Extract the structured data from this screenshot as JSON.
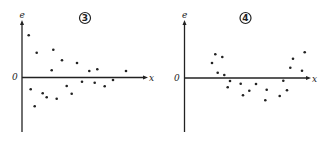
{
  "chart_data": [
    {
      "type": "scatter",
      "title": "3",
      "xlabel": "x",
      "ylabel": "e",
      "origin_label": "0",
      "grid": false,
      "description": "Residual plot: residuals e vs x, spread decreasing (funnel narrowing) as x increases",
      "origin_px": [
        22,
        77.5
      ],
      "points_px": [
        [
          28.7,
          35.3
        ],
        [
          36.7,
          52.7
        ],
        [
          53.3,
          49.7
        ],
        [
          62,
          60.3
        ],
        [
          77,
          63
        ],
        [
          51.7,
          70.3
        ],
        [
          89.3,
          71
        ],
        [
          97.3,
          69.3
        ],
        [
          126,
          71
        ],
        [
          30.7,
          89.3
        ],
        [
          42.7,
          93.3
        ],
        [
          46.7,
          97.3
        ],
        [
          34.7,
          106.3
        ],
        [
          56.7,
          98.7
        ],
        [
          66.7,
          86
        ],
        [
          71.7,
          93.7
        ],
        [
          82,
          81.7
        ],
        [
          94.7,
          82.7
        ],
        [
          104.7,
          86.3
        ],
        [
          113,
          80
        ]
      ]
    },
    {
      "type": "scatter",
      "title": "4",
      "xlabel": "x",
      "ylabel": "e",
      "origin_label": "0",
      "grid": false,
      "description": "Residual plot: residuals e vs x showing a curved (U-shaped) pattern",
      "origin_px": [
        184.5,
        78
      ],
      "points_px": [
        [
          212,
          63
        ],
        [
          215.3,
          54.3
        ],
        [
          222.3,
          57
        ],
        [
          217.7,
          72.7
        ],
        [
          224.3,
          75
        ],
        [
          230,
          81
        ],
        [
          227.7,
          87.3
        ],
        [
          240.7,
          83.7
        ],
        [
          243,
          95.3
        ],
        [
          249.3,
          90.7
        ],
        [
          256,
          84
        ],
        [
          266.7,
          89.7
        ],
        [
          265.3,
          100.3
        ],
        [
          279.7,
          96
        ],
        [
          287,
          90.3
        ],
        [
          283.3,
          80.7
        ],
        [
          290.3,
          67.7
        ],
        [
          293,
          58.7
        ],
        [
          302,
          70.7
        ],
        [
          304.7,
          52.3
        ]
      ]
    }
  ],
  "panels": [
    {
      "number": "3",
      "y_label": "e",
      "x_label": "x",
      "origin_label": "0",
      "axis": {
        "x0": 22,
        "y_top": 20,
        "y_bottom": 132,
        "x_axis_y": 77.5,
        "x_end": 148
      },
      "label_pos": {
        "e": [
          19.5,
          18
        ],
        "x": [
          149,
          81
        ],
        "o": [
          12,
          80
        ],
        "num": [
          85,
          18
        ]
      }
    },
    {
      "number": "4",
      "y_label": "e",
      "x_label": "x",
      "origin_label": "0",
      "axis": {
        "x0": 184.5,
        "y_top": 20,
        "y_bottom": 132,
        "x_axis_y": 78,
        "x_end": 311
      },
      "label_pos": {
        "e": [
          182,
          18
        ],
        "x": [
          312,
          82
        ],
        "o": [
          174,
          81
        ],
        "num": [
          245.5,
          18
        ]
      }
    }
  ],
  "colors": {
    "ink": "#222222",
    "background": "#ffffff"
  }
}
